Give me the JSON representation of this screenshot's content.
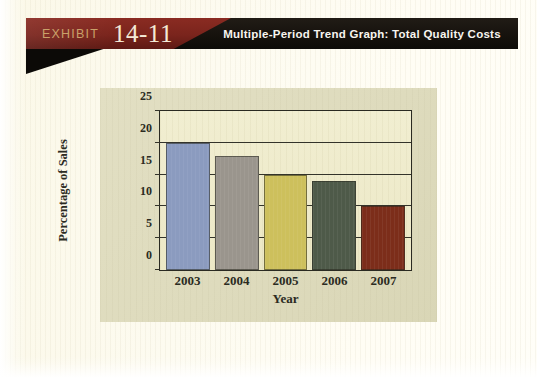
{
  "banner": {
    "exhibit_label": "EXHIBIT",
    "exhibit_number": "14-11",
    "title": "Multiple-Period Trend Graph: Total Quality Costs",
    "red_color": "#7a241c",
    "dark_color": "#16120d",
    "exhibit_label_color": "#c9a169",
    "exhibit_number_color": "#f4ead6",
    "title_color": "#f7f5ef"
  },
  "page": {
    "background_color": "#fdfbf0",
    "panel_color": "#dedbbd",
    "plot_background_color": "#ece8c6",
    "axis_color": "#2a2a22"
  },
  "chart_data": {
    "type": "bar",
    "title": "Multiple-Period Trend Graph: Total Quality Costs",
    "xlabel": "Year",
    "ylabel": "Percentage of Sales",
    "categories": [
      "2003",
      "2004",
      "2005",
      "2006",
      "2007"
    ],
    "values": [
      20,
      18,
      15,
      14,
      10
    ],
    "bar_colors": [
      "#8b9bbf",
      "#9a958d",
      "#cdc05c",
      "#4e5a49",
      "#7c2d1a"
    ],
    "ylim": [
      0,
      25
    ],
    "ytick_values": [
      0,
      5,
      10,
      15,
      20,
      25
    ],
    "ytick_labels": [
      "0",
      "5",
      "10",
      "15",
      "20",
      "25"
    ],
    "grid": true,
    "grid_axis": "y",
    "legend": false,
    "legend_position": "none"
  }
}
